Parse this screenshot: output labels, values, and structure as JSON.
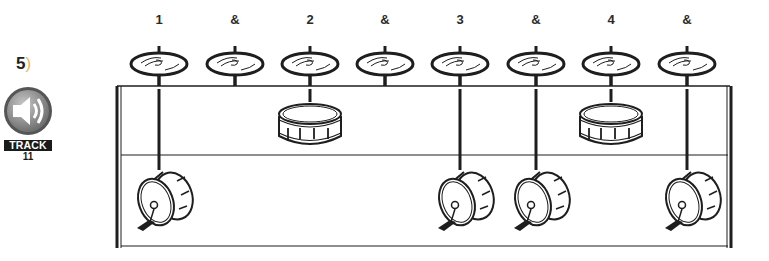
{
  "exercise": {
    "number": "5",
    "paren": ")"
  },
  "track": {
    "label": "TRACK",
    "number": "11",
    "icon": "speaker-icon"
  },
  "beats": [
    {
      "label": "1",
      "x": 159,
      "cymbal": true,
      "snare": false,
      "kick": true
    },
    {
      "label": "&",
      "x": 235,
      "cymbal": true,
      "snare": false,
      "kick": false
    },
    {
      "label": "2",
      "x": 310,
      "cymbal": true,
      "snare": true,
      "kick": false
    },
    {
      "label": "&",
      "x": 385,
      "cymbal": true,
      "snare": false,
      "kick": false
    },
    {
      "label": "3",
      "x": 460,
      "cymbal": true,
      "snare": false,
      "kick": true
    },
    {
      "label": "&",
      "x": 536,
      "cymbal": true,
      "snare": false,
      "kick": true
    },
    {
      "label": "4",
      "x": 611,
      "cymbal": true,
      "snare": true,
      "kick": false
    },
    {
      "label": "&",
      "x": 687,
      "cymbal": true,
      "snare": false,
      "kick": true
    }
  ],
  "colors": {
    "ink": "#1e1e1e",
    "accent": "#f2b25b",
    "badge_gray": "#8a8a8a"
  }
}
